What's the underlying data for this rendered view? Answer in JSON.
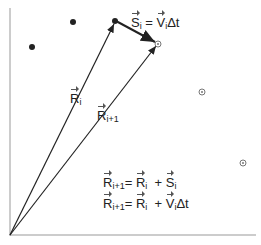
{
  "diagram": {
    "labels": {
      "R_i": {
        "symbol": "R",
        "sub": "i"
      },
      "R_i1": {
        "symbol": "R",
        "sub": "i+1"
      },
      "S_i_eq": {
        "lhs": "S",
        "lhs_sub": "i",
        "eq": " = ",
        "rhs": "V",
        "rhs_sub": "i",
        "tail": "Δt"
      },
      "eq1": {
        "lhs": "R",
        "lhs_sub": "i+1",
        "eq": "= ",
        "a": "R",
        "a_sub": "i",
        "plus": "  + ",
        "b": "S",
        "b_sub": "i"
      },
      "eq2": {
        "lhs": "R",
        "lhs_sub": "i+1",
        "eq": "= ",
        "a": "R",
        "a_sub": "i",
        "plus": "  + ",
        "b": "V",
        "b_sub": "i",
        "tail": "Δt"
      }
    },
    "points": {
      "solid": [
        [
          32,
          47
        ],
        [
          73,
          22
        ],
        [
          115,
          21
        ]
      ],
      "open": [
        [
          158,
          44
        ],
        [
          202,
          92
        ],
        [
          243,
          163
        ]
      ]
    },
    "colors": {
      "line": "#222222",
      "axis": "#999999"
    }
  }
}
